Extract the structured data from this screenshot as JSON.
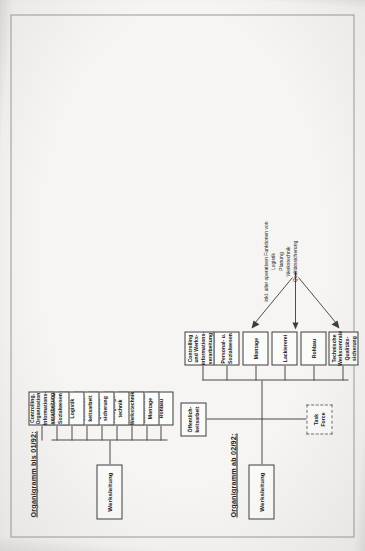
{
  "document": {
    "kind": "scanned-page",
    "orientation": "landscape-content-rotated-90ccw",
    "paper_color": "#f2f1ef",
    "ink_color": "#141414",
    "line_color": "#4a4a4a"
  },
  "charts": [
    {
      "id": "organigramm-bis-01-92",
      "title": "Organigramm bis 01/92:",
      "type": "org-chart",
      "root": {
        "id": "werksleitung-1",
        "label": "Werksleitung"
      },
      "children": [
        {
          "id": "rohbau-1",
          "label": "Rohbau"
        },
        {
          "id": "lackiererei-1",
          "label": "Lackiererei/\nMontage"
        },
        {
          "id": "werkstechnik-1",
          "label": "Werkstechnik"
        },
        {
          "id": "fertigung-1",
          "label": "Fertigungs-\ntechnik"
        },
        {
          "id": "qualitaet-1",
          "label": "Qualitäts-\nsicherung"
        },
        {
          "id": "oeffentlich-1",
          "label": "Öffentlich-\nkeitsarbeit"
        },
        {
          "id": "logistik-1",
          "label": "Logistik"
        },
        {
          "id": "personal-1",
          "label": "Personal- u.\nSozialwesen"
        },
        {
          "id": "controlling-1",
          "label": "Controlling,\nOrganisation\nInformations-\nverarbeitung"
        }
      ]
    },
    {
      "id": "organigramm-ab-02-92",
      "title": "Organigramm ab 02/92:",
      "type": "org-chart",
      "root": {
        "id": "werksleitung-2",
        "label": "Werksleitung"
      },
      "staff": [
        {
          "id": "oeffentlich-2",
          "label": "Öffentlich-\nkeitsarbeit",
          "style": "solid"
        },
        {
          "id": "taskforce-2",
          "label": "Task\nForce",
          "style": "dashed"
        }
      ],
      "children": [
        {
          "id": "technische-2",
          "label": "Technische\nWerkszentrale\nQualitäts-\nsicherung"
        },
        {
          "id": "rohbau-2",
          "label": "Rohbau"
        },
        {
          "id": "lackiererei-2",
          "label": "Lackiererei"
        },
        {
          "id": "montage-2",
          "label": "Montage"
        },
        {
          "id": "personal-2",
          "label": "Personal- u.\nSozialwesen"
        },
        {
          "id": "controlling-2",
          "label": "Controlling\nund Werks-\ninformations-\nverarbeitung"
        }
      ],
      "annotation": {
        "lead": "inkl. aller operativen Funktionen von",
        "items": [
          "Logistik",
          "Planung",
          "Werkstechnik",
          "Qualitätssicherung"
        ],
        "text": "inkl. aller operativen Funktionen von\nLogistik\nPlanung\nWerkstechnik\nQualitätssicherung",
        "points_to": [
          "rohbau-2",
          "lackiererei-2",
          "montage-2"
        ]
      }
    }
  ]
}
